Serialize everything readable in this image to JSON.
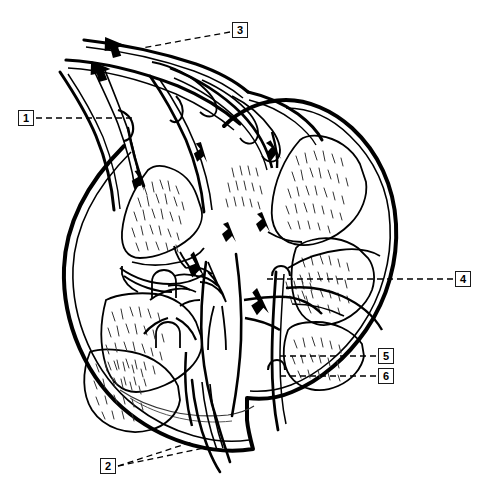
{
  "figure": {
    "type": "anatomical-line-drawing",
    "background_color": "#ffffff",
    "line_color": "#000000",
    "label_box_border_color": "#1a1a1a",
    "width": 486,
    "height": 488
  },
  "callouts": [
    {
      "id": "1",
      "label": "1",
      "x": 18,
      "y": 110,
      "leader": "dashed-horizontal-right"
    },
    {
      "id": "2",
      "label": "2",
      "x": 100,
      "y": 458,
      "leader": "dashed-diagonal-up-right"
    },
    {
      "id": "3",
      "label": "3",
      "x": 232,
      "y": 22,
      "leader": "dashed-diagonal-down-left"
    },
    {
      "id": "4",
      "label": "4",
      "x": 455,
      "y": 271,
      "leader": "dashed-horizontal-left"
    },
    {
      "id": "5",
      "label": "5",
      "x": 378,
      "y": 348,
      "leader": "dashed-horizontal-left"
    },
    {
      "id": "6",
      "label": "6",
      "x": 378,
      "y": 368,
      "leader": "dashed-horizontal-left"
    }
  ]
}
